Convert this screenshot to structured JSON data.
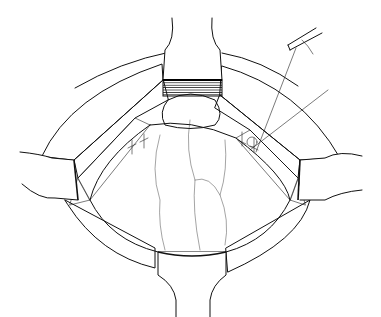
{
  "figure": {
    "colors": {
      "background": "#ffffff",
      "ink": "#111111"
    },
    "elements": [
      "top-retractor",
      "bottom-retractor",
      "left-retractor",
      "right-retractor",
      "upper-left-fat-layer",
      "upper-right-fat-layer",
      "lower-left-fat-layer",
      "lower-right-fat-layer",
      "exposed-organ-dome",
      "muscle-bands",
      "sutures",
      "needle-holder-instrument"
    ]
  }
}
